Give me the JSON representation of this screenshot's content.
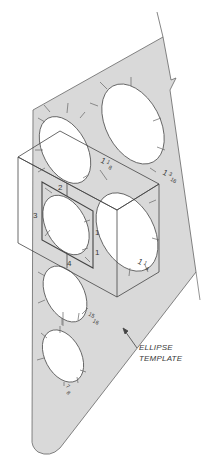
{
  "figure": {
    "callout": {
      "line1": "ELLIPSE",
      "line2": "TEMPLATE"
    },
    "template_size_labels": [
      {
        "whole": "1",
        "num": "1",
        "den": "8"
      },
      {
        "whole": "1",
        "num": "3",
        "den": "16"
      },
      {
        "whole": "1",
        "num": "1",
        "den": "4"
      },
      {
        "whole": "",
        "num": "15",
        "den": "16"
      },
      {
        "whole": "",
        "num": "7",
        "den": "8"
      }
    ],
    "front_face_edge_labels": {
      "top": "2",
      "left": "3",
      "right_upper": "1",
      "right_lower": "1",
      "bottom": "4"
    },
    "colors": {
      "template_fill": "#d9d9d9",
      "line": "#555555",
      "text": "#3a3a3a"
    }
  }
}
